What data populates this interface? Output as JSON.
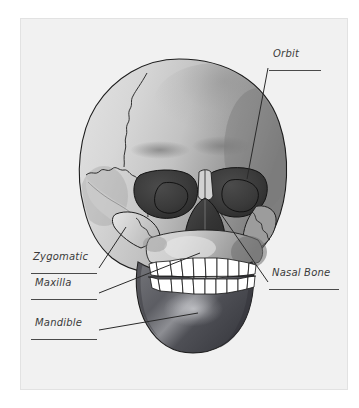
{
  "document": {
    "title": "Skull Anatomy Diagram",
    "medium": "hand-annotated printed illustration",
    "paper_color": "#f1f1f1",
    "page_color": "#ffffff",
    "ink_color": "#3a3a3a"
  },
  "figure": {
    "name": "human-skull-anterior-view",
    "bone_light": "#dcdcdc",
    "bone_mid": "#b4b4b4",
    "bone_shadow": "#8a8a8a",
    "cavity_dark": "#3c3c3c",
    "mandible_dark": "#55555a",
    "teeth_color": "#ffffff",
    "outline_color": "#1d1d1d"
  },
  "labels": [
    {
      "id": "orbit",
      "text": "Orbit",
      "underlined": true,
      "text_x": 273,
      "text_y": 55,
      "rule_x": 269,
      "rule_y": 70,
      "rule_width": 52,
      "leader": {
        "x1": 268,
        "y1": 68,
        "x2": 247,
        "y2": 179
      },
      "points_to": "left eye socket (viewer right)"
    },
    {
      "id": "nasal-bone",
      "text": "Nasal Bone",
      "underlined": true,
      "text_x": 272,
      "text_y": 274,
      "rule_x": 269,
      "rule_y": 289,
      "rule_width": 70,
      "leader": {
        "x1": 268,
        "y1": 282,
        "x2": 221,
        "y2": 214
      },
      "points_to": "nasal bone / bridge of nose"
    },
    {
      "id": "zygomatic",
      "text": "Zygomatic",
      "underlined": true,
      "text_x": 33,
      "text_y": 258,
      "rule_x": 31,
      "rule_y": 273,
      "rule_width": 66,
      "leader": {
        "x1": 99,
        "y1": 268,
        "x2": 126,
        "y2": 227
      },
      "points_to": "zygomatic arch / cheekbone"
    },
    {
      "id": "maxilla",
      "text": "Maxilla",
      "underlined": true,
      "text_x": 35,
      "text_y": 284,
      "rule_x": 31,
      "rule_y": 299,
      "rule_width": 66,
      "leader": {
        "x1": 99,
        "y1": 293,
        "x2": 200,
        "y2": 253
      },
      "points_to": "maxilla / upper jaw"
    },
    {
      "id": "mandible",
      "text": "Mandible",
      "underlined": true,
      "text_x": 35,
      "text_y": 324,
      "rule_x": 31,
      "rule_y": 339,
      "rule_width": 66,
      "leader": {
        "x1": 99,
        "y1": 330,
        "x2": 198,
        "y2": 313
      },
      "points_to": "mandible / lower jaw"
    }
  ]
}
